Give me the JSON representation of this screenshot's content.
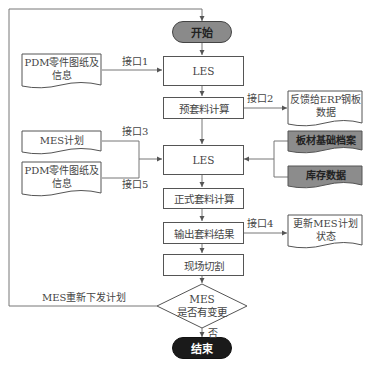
{
  "diagram": {
    "start": {
      "label": "开始",
      "fill": "#8a8a8a"
    },
    "end": {
      "label": "结束",
      "fill": "#1a1a1a"
    },
    "process": [
      {
        "id": "les1",
        "label": "LES"
      },
      {
        "id": "pre_nesting",
        "label": "预套料计算"
      },
      {
        "id": "les2",
        "label": "LES"
      },
      {
        "id": "formal_nesting",
        "label": "正式套料计算"
      },
      {
        "id": "output_result",
        "label": "输出套料结果"
      },
      {
        "id": "cutting",
        "label": "现场切割"
      }
    ],
    "decision": {
      "line1": "MES",
      "line2": "是否有变更",
      "no_label": "否"
    },
    "documents": {
      "pdm1": {
        "line1": "PDM零件图纸及",
        "line2": "信息"
      },
      "mes_plan": {
        "line1": "MES计划"
      },
      "pdm2": {
        "line1": "PDM零件图纸及",
        "line2": "信息"
      },
      "erp_feedback": {
        "line1": "反馈给ERP钢板",
        "line2": "数据"
      },
      "plate_archive": {
        "line1": "板材基础档案",
        "fill": "#8c8c8c"
      },
      "inventory": {
        "line1": "库存数据",
        "fill": "#8c8c8c"
      },
      "mes_update": {
        "line1": "更新MES计划",
        "line2": "状态"
      }
    },
    "interfaces": {
      "if1": "接口1",
      "if2": "接口2",
      "if3": "接口3",
      "if4": "接口4",
      "if5": "接口5"
    },
    "loop_label": "MES重新下发计划"
  }
}
